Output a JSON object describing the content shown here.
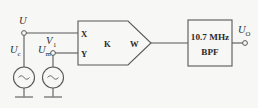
{
  "diagram": {
    "colors": {
      "background": "#f7f7f5",
      "line": "#58585a",
      "text": "#2b2b2b",
      "ground": "#8a8a8c"
    },
    "terminals": {
      "input_top": {
        "label": "U",
        "sub": ""
      },
      "node_v1": {
        "label": "V",
        "sub": "1"
      },
      "output": {
        "label": "U",
        "sub": "O"
      }
    },
    "sources": [
      {
        "name": "carrier-source",
        "label": "U",
        "sub": "c",
        "symbol": "~"
      },
      {
        "name": "modulating-source",
        "label": "U",
        "sub": "m",
        "symbol": "~"
      }
    ],
    "multiplier": {
      "name": "analog-multiplier",
      "input_x": "X",
      "input_y": "Y",
      "gain": "K",
      "output_w": "W"
    },
    "filter": {
      "name": "bandpass-filter",
      "line1": "10.7 MHz",
      "line2": "BPF"
    }
  }
}
